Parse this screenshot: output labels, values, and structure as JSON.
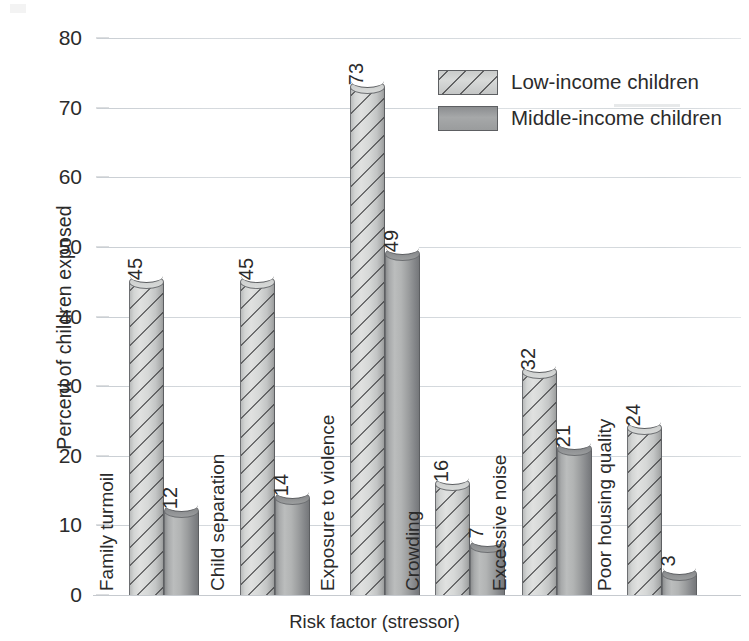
{
  "chart_data": {
    "type": "bar",
    "title": "",
    "xlabel": "Risk factor (stressor)",
    "ylabel": "Percent of children exposed",
    "ylim": [
      0,
      80
    ],
    "ytick_step": 10,
    "yticks": [
      80,
      70,
      60,
      50,
      40,
      30,
      20,
      10,
      0
    ],
    "grid": true,
    "legend_position": "top-right",
    "categories": [
      "Family turmoil",
      "Child separation",
      "Exposure to violence",
      "Crowding",
      "Excessive noise",
      "Poor housing quality"
    ],
    "series": [
      {
        "name": "Low-income children",
        "values": [
          45,
          45,
          73,
          16,
          32,
          24
        ]
      },
      {
        "name": "Middle-income children",
        "values": [
          12,
          14,
          49,
          7,
          21,
          3
        ]
      }
    ],
    "value_labels": [
      [
        "45",
        "12"
      ],
      [
        "45",
        "14"
      ],
      [
        "73",
        "49"
      ],
      [
        "16",
        "7"
      ],
      [
        "32",
        "21"
      ],
      [
        "24",
        "3"
      ]
    ]
  },
  "legend": {
    "items": [
      {
        "label": "Low-income children",
        "swatch": "hatched-light-gray"
      },
      {
        "label": "Middle-income children",
        "swatch": "solid-gray"
      }
    ]
  },
  "colors": {
    "gridline": "#d3d7db",
    "axis": "#c6cacf",
    "text": "#2b2b2b",
    "series_low": "#d6d8d7",
    "series_mid": "#a8aaab",
    "background": "#ffffff"
  }
}
